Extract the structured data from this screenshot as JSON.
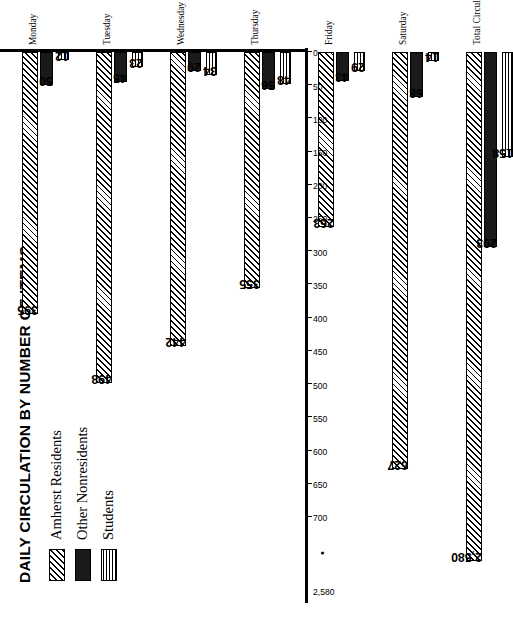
{
  "chart_data": {
    "type": "bar",
    "title": "DAILY CIRCULATION BY NUMBER OF ITEMS",
    "orientation": "horizontal",
    "xlabel": "",
    "ylabel": "",
    "grid": false,
    "legend_position": "top-left",
    "categories": [
      "Monday",
      "Tuesday",
      "Wednesday",
      "Thursday",
      "Friday",
      "Saturday",
      "Total Circulation"
    ],
    "series": [
      {
        "name": "Amherst Residents",
        "pattern": "diagonal-hatch",
        "values": [
          395,
          498,
          442,
          355,
          263,
          627,
          2580
        ]
      },
      {
        "name": "Other Nonresidents",
        "pattern": "solid-black",
        "values": [
          50,
          45,
          29,
          56,
          43,
          68,
          293
        ]
      },
      {
        "name": "Students",
        "pattern": "cross-grid",
        "values": [
          12,
          23,
          34,
          48,
          29,
          14,
          158
        ]
      }
    ],
    "axis_ticks": [
      "0",
      "50",
      "100",
      "150",
      "200",
      "250",
      "300",
      "350",
      "400",
      "450",
      "500",
      "550",
      "600",
      "650",
      "700",
      "2,580"
    ],
    "axis_break_between": [
      "700",
      "2,580"
    ],
    "axis_break_marker": "•",
    "xlim": [
      0,
      700
    ],
    "value_labels": {
      "Monday": [
        "395",
        "50",
        "12"
      ],
      "Tuesday": [
        "498",
        "45",
        "23"
      ],
      "Wednesday": [
        "442",
        "29",
        "34"
      ],
      "Thursday": [
        "355",
        "56",
        "48"
      ],
      "Friday": [
        "263",
        "43",
        "29"
      ],
      "Saturday": [
        "627",
        "68",
        "14"
      ],
      "Total Circulation": [
        "2,580",
        "293",
        "158"
      ]
    }
  },
  "colors": {
    "ink": "#000000",
    "paper": "#ffffff",
    "solid_fill": "#1a1a1a"
  }
}
